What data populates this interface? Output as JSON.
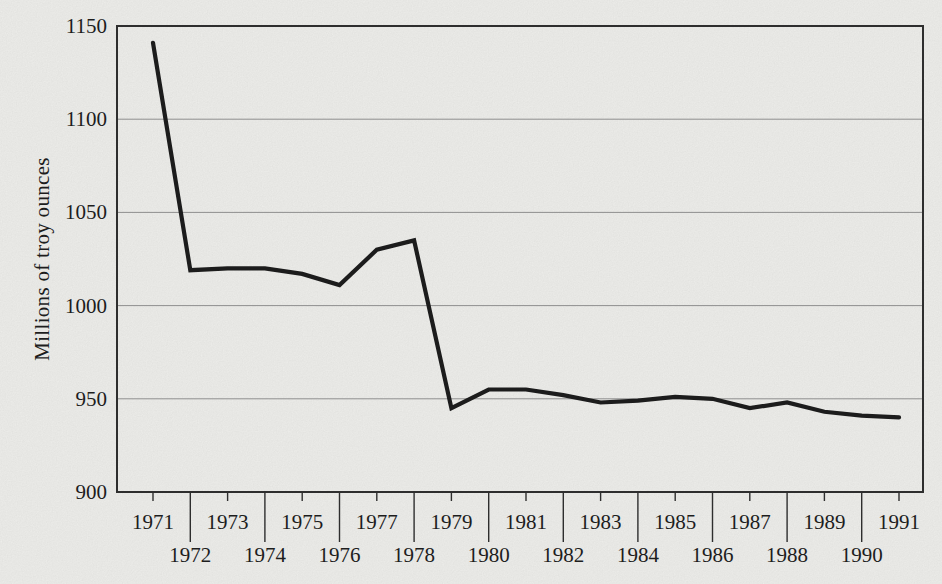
{
  "figure": {
    "background_color": "#f1f1ee",
    "ink_color": "#1c1c1c"
  },
  "chart_data": {
    "type": "line",
    "title": "",
    "xlabel": "",
    "ylabel": "Millions of troy ounces",
    "categories": [
      1971,
      1972,
      1973,
      1974,
      1975,
      1976,
      1977,
      1978,
      1979,
      1980,
      1981,
      1982,
      1983,
      1984,
      1985,
      1986,
      1987,
      1988,
      1989,
      1990,
      1991
    ],
    "values": [
      1141,
      1019,
      1020,
      1020,
      1017,
      1011,
      1030,
      1035,
      945,
      955,
      955,
      952,
      948,
      949,
      951,
      950,
      945,
      948,
      943,
      941,
      940
    ],
    "ylim": [
      900,
      1150
    ],
    "yticks": [
      900,
      950,
      1000,
      1050,
      1100,
      1150
    ],
    "ytick_labels": [
      "900",
      "950",
      "1000",
      "1050",
      "1100",
      "1150"
    ],
    "grid": "horizontal-only",
    "legend_position": "none",
    "x_tick_label_layout": "staggered-two-rows",
    "line_color": "#1c1c1c",
    "grid_color": "#8f8f8f",
    "frame_color": "#2e2e2e",
    "label_color": "#1d1d1d"
  }
}
